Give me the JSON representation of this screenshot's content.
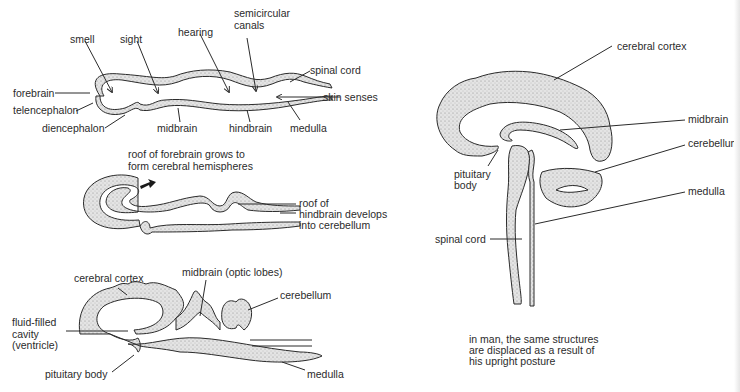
{
  "diagram1": {
    "labels": {
      "smell": "smell",
      "sight": "sight",
      "hearing": "hearing",
      "semicircular_canals_1": "semicircular",
      "semicircular_canals_2": "canals",
      "spinal_cord": "spinal cord",
      "forebrain": "forebrain",
      "skin_senses": "skin senses",
      "telencephalon": "telencephalon",
      "diencephalon": "diencephalon",
      "midbrain": "midbrain",
      "hindbrain": "hindbrain",
      "medulla": "medulla"
    }
  },
  "diagram2": {
    "caption_top_1": "roof of forebrain grows to",
    "caption_top_2": "form cerebral hemispheres",
    "label_right_1": "roof of",
    "label_right_2": "hindbrain develops",
    "label_right_3": "into cerebellum"
  },
  "diagram3": {
    "labels": {
      "cerebral_cortex": "cerebral cortex",
      "midbrain_optic_lobes": "midbrain (optic lobes)",
      "cerebellum": "cerebellum",
      "fluid_filled_1": "fluid-filled",
      "fluid_filled_2": "cavity",
      "fluid_filled_3": "(ventricle)",
      "pituitary_body": "pituitary body",
      "medulla": "medulla"
    }
  },
  "diagram4": {
    "labels": {
      "cerebral_cortex": "cerebral cortex",
      "midbrain": "midbrain",
      "cerebellum": "cerebellum",
      "pituitary_1": "pituitary",
      "pituitary_2": "body",
      "medulla": "medulla",
      "spinal_cord": "spinal cord"
    },
    "caption_1": "in man, the same structures",
    "caption_2": "are displaced as a result of",
    "caption_3": "his upright posture"
  },
  "colors": {
    "ink": "#2b2b2b",
    "tissue_fill": "#d6d6d6",
    "background": "#ffffff"
  }
}
